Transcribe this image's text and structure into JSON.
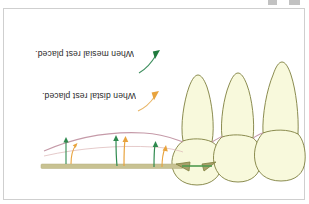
{
  "window": {
    "top_icons": [
      "window-control-icon-1",
      "window-control-icon-2"
    ]
  },
  "figure": {
    "title": "",
    "orientation_degrees": 180,
    "background_color": "#ffffff",
    "frame_border_color": "#cfcfcf",
    "captions": [
      {
        "id": "mesial-rest-caption",
        "text": "When mesial rest placed.",
        "color": "#2b2b2b",
        "pointer_color": "#1f7a3d",
        "pointer_name": "mesial-pointer-arrow"
      },
      {
        "id": "distal-rest-caption",
        "text": "When distal rest placed.",
        "color": "#2b2b2b",
        "pointer_color": "#e8a33d",
        "pointer_name": "distal-pointer-arrow"
      }
    ],
    "colors": {
      "tooth_fill": "#f8f9dc",
      "tooth_outline": "#7e7f3e",
      "gingiva_line": "#c59aa8",
      "baseline_bar": "#c8c292",
      "mesial_force": "#2f8a4f",
      "distal_force": "#e8a33d",
      "rest_connector": "#4f9a4f",
      "rest_fill": "#a8a06a"
    },
    "force_arrows": {
      "mesial_label": "mesial displacement vectors",
      "distal_label": "distal displacement vectors",
      "count": 3
    },
    "teeth": {
      "count": 3,
      "label": "posterior-abutment-teeth"
    },
    "rests": {
      "count": 2,
      "label": "occlusal-rest-seat"
    }
  }
}
